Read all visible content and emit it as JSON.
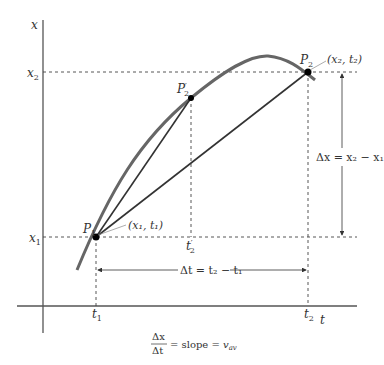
{
  "diagram": {
    "axes": {
      "vertical_label": "x",
      "horizontal_label": "t"
    },
    "ticks": {
      "x1": {
        "base": "x",
        "sub": "1"
      },
      "x2": {
        "base": "x",
        "sub": "2"
      },
      "t1": {
        "base": "t",
        "sub": "1"
      },
      "t2": {
        "base": "t",
        "sub": "2"
      },
      "t2_prime": {
        "base": "t",
        "prime": "′",
        "sub": "2"
      }
    },
    "points": {
      "P1": {
        "base": "P",
        "sub": "1",
        "coord": "(x₁, t₁)"
      },
      "P2": {
        "base": "P",
        "sub": "2",
        "coord": "(x₂, t₂)"
      },
      "P2_prime": {
        "base": "P",
        "prime": "′",
        "sub": "2"
      }
    },
    "annotations": {
      "delta_x": "Δx = x₂ − x₁",
      "delta_t": "Δt = t₂ − t₁"
    },
    "formula": {
      "numerator": "Δx",
      "denominator": "Δt",
      "rest": "= slope = ",
      "v": "v",
      "v_sub": "av"
    },
    "colors": {
      "curve": "#666666",
      "lines": "#333333",
      "dashes": "#444444"
    }
  }
}
